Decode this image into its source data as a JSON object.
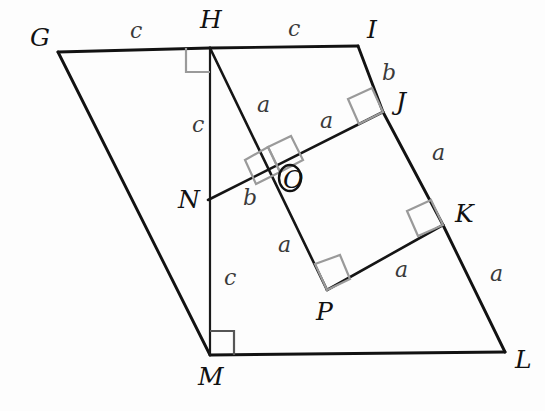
{
  "figure": {
    "background_color": "#fdfdfd",
    "stroke_color": "#121212",
    "right_angle_mark_color": "#9a9a9a",
    "label_color": "#111111",
    "side_label_color": "#3a3a3a"
  },
  "vertices": [
    {
      "id": "G",
      "label": "G",
      "x": 58,
      "y": 52,
      "label_x": 30,
      "label_y": 46
    },
    {
      "id": "H",
      "label": "H",
      "x": 210,
      "y": 48,
      "label_x": 200,
      "label_y": 28
    },
    {
      "id": "I",
      "label": "I",
      "x": 358,
      "y": 46,
      "label_x": 367,
      "label_y": 38
    },
    {
      "id": "J",
      "label": "J",
      "x": 383,
      "y": 112,
      "label_x": 396,
      "label_y": 110
    },
    {
      "id": "K",
      "label": "K",
      "x": 443,
      "y": 225,
      "label_x": 455,
      "label_y": 222
    },
    {
      "id": "L",
      "label": "L",
      "x": 505,
      "y": 352,
      "label_x": 515,
      "label_y": 368
    },
    {
      "id": "M",
      "label": "M",
      "x": 210,
      "y": 355,
      "label_x": 198,
      "label_y": 385
    },
    {
      "id": "N",
      "label": "N",
      "x": 208,
      "y": 200,
      "label_x": 178,
      "label_y": 205
    },
    {
      "id": "O",
      "label": "O",
      "x": 280,
      "y": 172,
      "label_x": 284,
      "label_y": 186
    },
    {
      "id": "P",
      "label": "P",
      "x": 327,
      "y": 290,
      "label_x": 316,
      "label_y": 320
    }
  ],
  "segments": [
    {
      "id": "GH",
      "from": "G",
      "to": "H",
      "kind": "main"
    },
    {
      "id": "HI",
      "from": "H",
      "to": "I",
      "kind": "main"
    },
    {
      "id": "IJ",
      "from": "I",
      "to": "J",
      "kind": "main"
    },
    {
      "id": "JK",
      "from": "J",
      "to": "K",
      "kind": "main"
    },
    {
      "id": "KL",
      "from": "K",
      "to": "L",
      "kind": "main"
    },
    {
      "id": "ML",
      "from": "M",
      "to": "L",
      "kind": "main"
    },
    {
      "id": "GM",
      "from": "G",
      "to": "M",
      "kind": "main"
    },
    {
      "id": "HM",
      "from": "H",
      "to": "M",
      "kind": "thin"
    },
    {
      "id": "HP",
      "from": "H",
      "to": "P",
      "kind": "inner"
    },
    {
      "id": "NJ",
      "from": "N",
      "to": "J",
      "kind": "inner"
    },
    {
      "id": "PK",
      "from": "P",
      "to": "K",
      "kind": "inner"
    }
  ],
  "side_labels": [
    {
      "id": "c-GH",
      "text": "c",
      "x": 130,
      "y": 38
    },
    {
      "id": "c-HI",
      "text": "c",
      "x": 288,
      "y": 36
    },
    {
      "id": "b-IJ",
      "text": "b",
      "x": 382,
      "y": 80
    },
    {
      "id": "a-HN",
      "text": "a",
      "x": 257,
      "y": 112
    },
    {
      "id": "a-OJ",
      "text": "a",
      "x": 320,
      "y": 128
    },
    {
      "id": "a-JK",
      "text": "a",
      "x": 432,
      "y": 160
    },
    {
      "id": "c-HN2",
      "text": "c",
      "x": 192,
      "y": 132
    },
    {
      "id": "b-NO",
      "text": "b",
      "x": 243,
      "y": 205
    },
    {
      "id": "a-OP",
      "text": "a",
      "x": 278,
      "y": 252
    },
    {
      "id": "c-NM",
      "text": "c",
      "x": 224,
      "y": 285
    },
    {
      "id": "a-PK",
      "text": "a",
      "x": 395,
      "y": 277
    },
    {
      "id": "a-KL",
      "text": "a",
      "x": 490,
      "y": 281
    }
  ],
  "right_angle_marks": [
    {
      "id": "rt-at-H",
      "at": "H",
      "style": "gray"
    },
    {
      "id": "rt-at-M",
      "at": "M",
      "style": "dark"
    },
    {
      "id": "rt-at-J",
      "at": "J",
      "style": "gray"
    },
    {
      "id": "rt-at-K",
      "at": "K",
      "style": "gray"
    },
    {
      "id": "rt-at-P",
      "at": "P",
      "style": "gray"
    },
    {
      "id": "rt-at-O-1",
      "at": "O",
      "style": "gray"
    },
    {
      "id": "rt-at-O-2",
      "at": "O",
      "style": "gray"
    }
  ]
}
